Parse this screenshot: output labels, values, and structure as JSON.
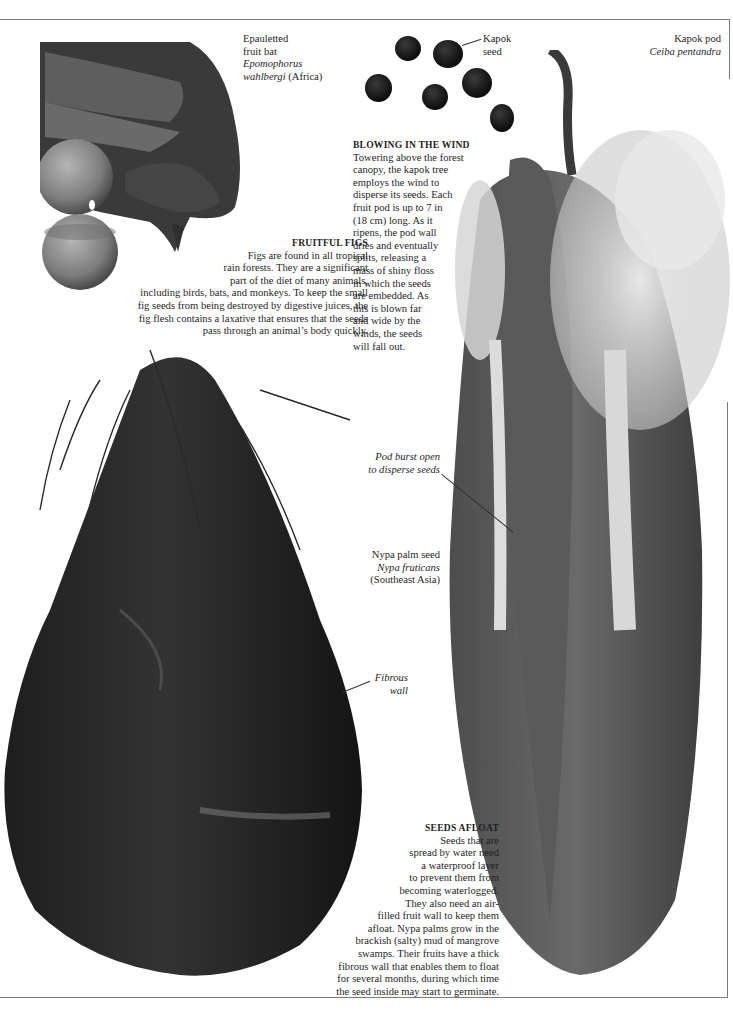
{
  "page": {
    "colors": {
      "background": "#ffffff",
      "text": "#1f1f1f",
      "frame": "#7a7a7a"
    }
  },
  "bat_caption": {
    "common_name_line1": "Epauletted",
    "common_name_line2": "fruit bat",
    "latin_line1": "Epomophorus",
    "latin_line2": "wahlbergi",
    "region": "(Africa)"
  },
  "kapok_seed_label": {
    "line1": "Kapok",
    "line2": "seed"
  },
  "kapok_pod_caption": {
    "common_name": "Kapok pod",
    "latin": "Ceiba pentandra"
  },
  "fruitful_figs": {
    "heading": "FRUITFUL FIGS",
    "lines": [
      "Figs are found in all tropical",
      "rain forests. They are a significant",
      "part of the diet of many animals,",
      "including birds, bats, and monkeys. To keep the small",
      "fig seeds from being destroyed by digestive juices, the",
      "fig flesh contains a laxative that ensures that the seeds",
      "pass through an animal’s body quickly."
    ]
  },
  "blowing_in_the_wind": {
    "heading": "BLOWING IN THE WIND",
    "lines": [
      "Towering above the forest",
      "canopy, the kapok tree",
      "employs the wind to",
      "disperse its seeds. Each",
      "fruit pod is up to  7 in",
      "(18 cm) long. As it",
      "ripens, the pod wall",
      "dries and eventually",
      "splits, releasing a",
      "mass of shiny floss",
      "in which the seeds",
      "are embedded. As",
      "this is blown far",
      "and wide by the",
      "winds, the seeds",
      "will fall out."
    ]
  },
  "pod_burst_label": {
    "line1": "Pod burst open",
    "line2": "to disperse seeds"
  },
  "nypa_caption": {
    "common_name": "Nypa palm seed",
    "latin": "Nypa fruticans",
    "region": "(Southeast Asia)"
  },
  "fibrous_wall_label": {
    "line1": "Fibrous",
    "line2": "wall"
  },
  "seeds_afloat": {
    "heading": "SEEDS AFLOAT",
    "lines": [
      "Seeds that are",
      "spread by water need",
      "a waterproof layer",
      "to prevent them from",
      "becoming waterlogged.",
      "They also need an air-",
      "filled fruit wall to keep them",
      "afloat. Nypa palms grow in the",
      "brackish  (salty) mud of mangrove",
      "swamps. Their fruits have a thick",
      "fibrous wall that enables them to float",
      "for several months, during which time",
      "the seed inside may start to germinate."
    ]
  }
}
